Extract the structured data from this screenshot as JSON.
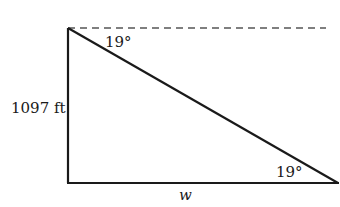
{
  "diagram": {
    "type": "right-triangle-angle-of-depression",
    "top_angle_label": "19°",
    "bottom_angle_label": "19°",
    "height_label": "1097 ft",
    "base_label": "w",
    "colors": {
      "stroke": "#1a1a1a",
      "dashed": "#555555",
      "background": "#ffffff"
    }
  }
}
